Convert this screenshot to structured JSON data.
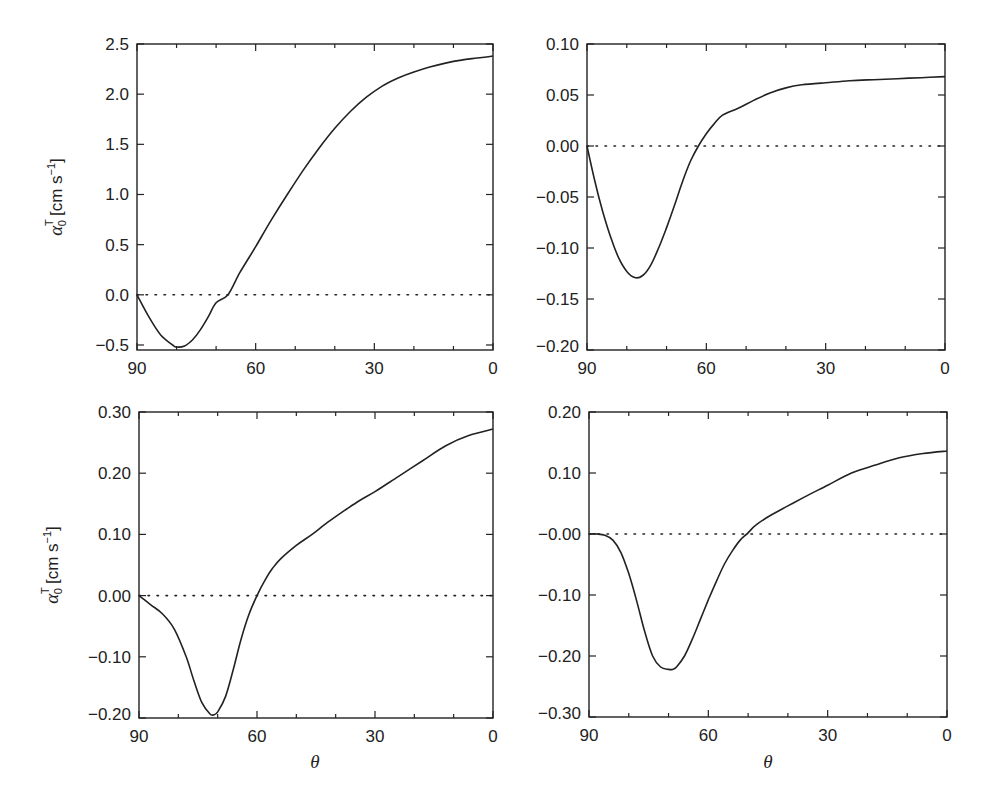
{
  "figure": {
    "ylabel_main": "α",
    "ylabel_sup": "T",
    "ylabel_sub": "0",
    "ylabel_units": "[cm s",
    "ylabel_units_sup": "−1",
    "ylabel_units_end": "]",
    "xlabel": "θ",
    "line_color": "#222222",
    "reference_line_style": "dotted"
  },
  "chart_data": [
    {
      "type": "line",
      "panel": "top-left",
      "title": "",
      "xlabel": "",
      "ylabel": "α0^T [cm s^-1]",
      "xlim": [
        90,
        0
      ],
      "ylim": [
        -0.55,
        2.5
      ],
      "xticks": [
        90,
        60,
        30,
        0
      ],
      "xtick_labels": [
        "90",
        "60",
        "30",
        "0"
      ],
      "yticks": [
        -0.5,
        0.0,
        0.5,
        1.0,
        1.5,
        2.0,
        2.5
      ],
      "ytick_labels": [
        "-0.5",
        "0.0",
        "0.5",
        "1.0",
        "1.5",
        "2.0",
        "2.5"
      ],
      "grid": false,
      "reference_line": 0.0,
      "series": [
        {
          "name": "alpha0T",
          "x": [
            90,
            87,
            84,
            81,
            80,
            78,
            76,
            74,
            72,
            70,
            67,
            64,
            60,
            56,
            52,
            48,
            44,
            40,
            36,
            32,
            28,
            24,
            20,
            16,
            12,
            8,
            4,
            0
          ],
          "y": [
            0.0,
            -0.22,
            -0.4,
            -0.5,
            -0.52,
            -0.51,
            -0.45,
            -0.35,
            -0.22,
            -0.08,
            0.0,
            0.22,
            0.48,
            0.75,
            1.0,
            1.24,
            1.46,
            1.66,
            1.83,
            1.97,
            2.08,
            2.16,
            2.22,
            2.27,
            2.31,
            2.34,
            2.36,
            2.38
          ]
        }
      ]
    },
    {
      "type": "line",
      "panel": "top-right",
      "title": "",
      "xlabel": "",
      "ylabel": "",
      "xlim": [
        90,
        0
      ],
      "ylim": [
        -0.2,
        0.1
      ],
      "xticks": [
        90,
        60,
        30,
        0
      ],
      "xtick_labels": [
        "90",
        "60",
        "30",
        "0"
      ],
      "yticks": [
        -0.2,
        -0.15,
        -0.1,
        -0.05,
        0.0,
        0.05,
        0.1
      ],
      "ytick_labels": [
        "-0.20",
        "-0.15",
        "-0.10",
        "-0.05",
        "0.00",
        "0.05",
        "0.10"
      ],
      "grid": false,
      "reference_line": 0.0,
      "series": [
        {
          "name": "alpha0T",
          "x": [
            90,
            88,
            86,
            84,
            82,
            80,
            78,
            76,
            74,
            72,
            70,
            68,
            66,
            64,
            62,
            60,
            58,
            56,
            52,
            48,
            44,
            40,
            36,
            30,
            24,
            18,
            12,
            6,
            0
          ],
          "y": [
            0.0,
            -0.035,
            -0.065,
            -0.09,
            -0.11,
            -0.123,
            -0.129,
            -0.127,
            -0.117,
            -0.1,
            -0.08,
            -0.058,
            -0.035,
            -0.015,
            0.0,
            0.012,
            0.022,
            0.03,
            0.037,
            0.045,
            0.052,
            0.057,
            0.06,
            0.062,
            0.064,
            0.065,
            0.066,
            0.067,
            0.068
          ]
        }
      ]
    },
    {
      "type": "line",
      "panel": "bottom-left",
      "title": "",
      "xlabel": "θ",
      "ylabel": "α0^T [cm s^-1]",
      "xlim": [
        90,
        0
      ],
      "ylim": [
        -0.2,
        0.3
      ],
      "xticks": [
        90,
        60,
        30,
        0
      ],
      "xtick_labels": [
        "90",
        "60",
        "30",
        "0"
      ],
      "yticks": [
        -0.2,
        -0.1,
        0.0,
        0.1,
        0.2,
        0.3
      ],
      "ytick_labels": [
        "-0.20",
        "-0.10",
        "0.00",
        "0.10",
        "0.20",
        "0.30"
      ],
      "grid": false,
      "reference_line": 0.0,
      "series": [
        {
          "name": "alpha0T",
          "x": [
            90,
            87,
            84,
            81,
            78,
            76,
            74,
            72,
            71,
            70,
            68,
            66,
            64,
            62,
            60,
            58,
            56,
            54,
            50,
            46,
            42,
            38,
            34,
            30,
            24,
            18,
            12,
            6,
            0
          ],
          "y": [
            0.0,
            -0.015,
            -0.03,
            -0.055,
            -0.1,
            -0.14,
            -0.175,
            -0.193,
            -0.195,
            -0.19,
            -0.165,
            -0.12,
            -0.07,
            -0.03,
            0.0,
            0.025,
            0.045,
            0.06,
            0.082,
            0.1,
            0.12,
            0.138,
            0.155,
            0.17,
            0.195,
            0.22,
            0.245,
            0.262,
            0.272
          ]
        }
      ]
    },
    {
      "type": "line",
      "panel": "bottom-right",
      "title": "",
      "xlabel": "θ",
      "ylabel": "",
      "xlim": [
        90,
        0
      ],
      "ylim": [
        -0.3,
        0.2
      ],
      "xticks": [
        90,
        60,
        30,
        0
      ],
      "xtick_labels": [
        "90",
        "60",
        "30",
        "0"
      ],
      "yticks": [
        -0.3,
        -0.2,
        -0.1,
        0.0,
        0.1,
        0.2
      ],
      "ytick_labels": [
        "-0.30",
        "-0.20",
        "-0.10",
        "-0.00",
        "0.10",
        "0.20"
      ],
      "grid": false,
      "reference_line": 0.0,
      "series": [
        {
          "name": "alpha0T",
          "x": [
            90,
            88,
            86,
            84,
            82,
            80,
            78,
            76,
            74,
            72,
            70,
            69,
            68,
            66,
            64,
            62,
            60,
            58,
            56,
            54,
            52,
            50,
            48,
            44,
            40,
            36,
            30,
            24,
            18,
            12,
            6,
            0
          ],
          "y": [
            0.0,
            0.0,
            -0.002,
            -0.01,
            -0.03,
            -0.065,
            -0.11,
            -0.16,
            -0.2,
            -0.218,
            -0.222,
            -0.222,
            -0.218,
            -0.2,
            -0.172,
            -0.14,
            -0.108,
            -0.078,
            -0.05,
            -0.028,
            -0.01,
            0.002,
            0.015,
            0.032,
            0.046,
            0.06,
            0.08,
            0.1,
            0.113,
            0.125,
            0.132,
            0.136
          ]
        }
      ]
    }
  ]
}
